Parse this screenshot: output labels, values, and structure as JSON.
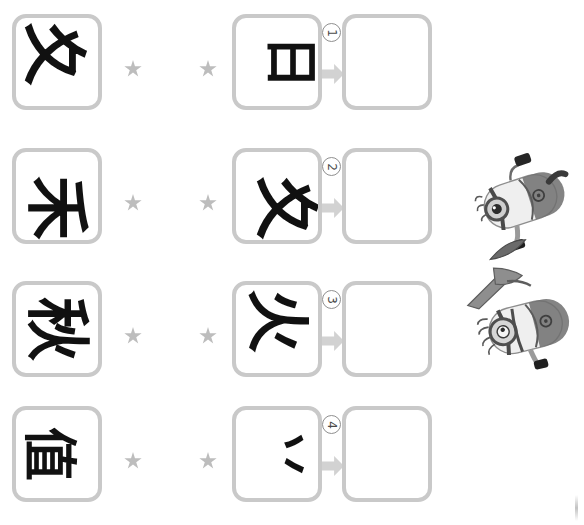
{
  "page": {
    "background_color": "#ffffff",
    "box_border_color": "#c9c9c9",
    "ink_color": "#111111",
    "star_color": "#bdbdbd",
    "arrow_color": "#d2d2d2",
    "step_circle_color": "#8f8f8f"
  },
  "icons": {
    "star": "star-icon",
    "arrow": "arrow-right-icon",
    "step_circle": "circled-number-icon"
  },
  "rows": [
    {
      "step_number": "1",
      "prompt_glyph": "夊",
      "source_glyph": "日",
      "answer_glyph": ""
    },
    {
      "step_number": "2",
      "prompt_glyph": "禾",
      "source_glyph": "夊",
      "answer_glyph": ""
    },
    {
      "step_number": "3",
      "prompt_glyph": "秋",
      "source_glyph": "火",
      "answer_glyph": ""
    },
    {
      "step_number": "4",
      "prompt_glyph": "值",
      "source_glyph": "丷",
      "answer_glyph": ""
    }
  ],
  "stickers": [
    {
      "label": "minion-figure-top"
    },
    {
      "label": "minion-figure-bottom"
    }
  ]
}
